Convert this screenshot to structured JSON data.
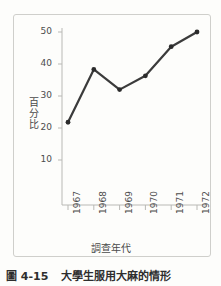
{
  "figure": {
    "caption_number": "圖 4-15",
    "caption_title": "大學生服用大麻的情形"
  },
  "colors": {
    "line": "#3b3b3b",
    "marker": "#2b2b2b",
    "axis": "#b9b9b5",
    "frame": "#cfcfcb",
    "background": "#fdfdfb",
    "text": "#4c4c4c"
  },
  "chart_data": {
    "type": "line",
    "title": "大學生服用大麻的情形",
    "xlabel": "調查年代",
    "ylabel": "百分比",
    "ylabel_chars": [
      "百",
      "分",
      "比"
    ],
    "categories": [
      "1967",
      "1968",
      "1969",
      "1970",
      "1971",
      "1972"
    ],
    "values": [
      21.8,
      38.3,
      32.0,
      36.3,
      45.4,
      50.0
    ],
    "yticks": [
      10,
      20,
      30,
      40,
      50
    ],
    "ytick_labels": [
      "10",
      "20",
      "30",
      "40",
      "50"
    ],
    "ylim": [
      0,
      52
    ],
    "grid": false,
    "legend": null,
    "markers": true,
    "xtick_rotation": -90
  }
}
